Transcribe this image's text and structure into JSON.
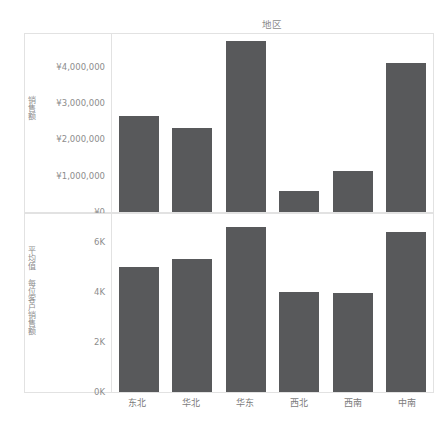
{
  "header": {
    "column_title": "地区",
    "top_caption": "",
    "bottom_caption": ""
  },
  "chart_data": [
    {
      "type": "bar",
      "title": "地区",
      "panel": "top",
      "ylabel": "销售额",
      "xlabel": "",
      "categories": [
        "东北",
        "华北",
        "华东",
        "西北",
        "西南",
        "中南"
      ],
      "values": [
        2630000,
        2320000,
        4700000,
        580000,
        1130000,
        4100000
      ],
      "ytick_labels": [
        "¥4,000,000",
        "¥3,000,000",
        "¥2,000,000",
        "¥1,000,000",
        "¥0"
      ],
      "ytick_values": [
        4000000,
        3000000,
        2000000,
        1000000,
        0
      ],
      "ylim": [
        0,
        4900000
      ],
      "grid": false,
      "legend": "none",
      "bar_color": "#58595b"
    },
    {
      "type": "bar",
      "title": "",
      "panel": "bottom",
      "ylabel": "平均值 每位客户销售额",
      "xlabel": "",
      "categories": [
        "东北",
        "华北",
        "华东",
        "西北",
        "西南",
        "中南"
      ],
      "values": [
        5000,
        5300,
        6600,
        4000,
        3950,
        6400
      ],
      "ytick_labels": [
        "6K",
        "4K",
        "2K",
        "0K"
      ],
      "ytick_values": [
        6000,
        4000,
        2000,
        0
      ],
      "ylim": [
        0,
        7100
      ],
      "grid": false,
      "legend": "none",
      "bar_color": "#58595b"
    }
  ]
}
